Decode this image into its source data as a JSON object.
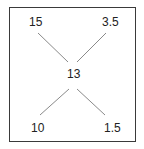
{
  "diagram": {
    "center": "13",
    "top_left": "15",
    "top_right": "3.5",
    "bottom_left": "10",
    "bottom_right": "1.5"
  }
}
